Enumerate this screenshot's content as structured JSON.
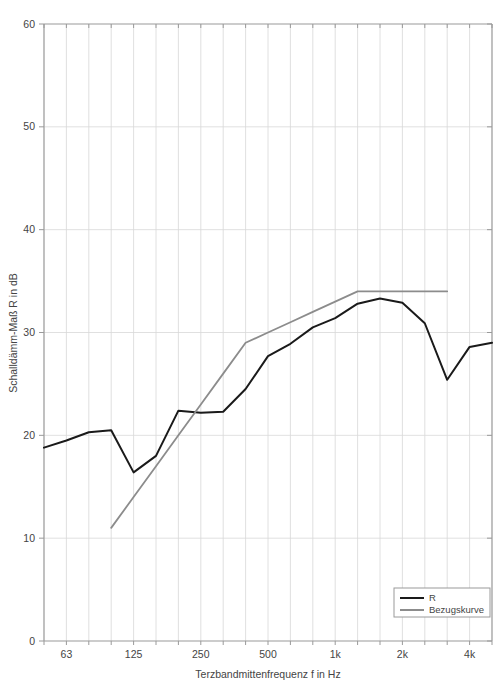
{
  "chart_data": {
    "type": "line",
    "title": "",
    "xlabel": "Terzbandmittenfrequenz f in Hz",
    "ylabel": "Schalldämm-Maß R in dB",
    "x_scale": "log-third-octave",
    "x_bands": [
      50,
      63,
      80,
      100,
      125,
      160,
      200,
      250,
      315,
      400,
      500,
      630,
      800,
      1000,
      1250,
      1600,
      2000,
      2500,
      3150,
      4000,
      5000
    ],
    "x_tick_labels": [
      "",
      "63",
      "",
      "",
      "125",
      "",
      "",
      "250",
      "",
      "",
      "500",
      "",
      "",
      "1k",
      "",
      "",
      "2k",
      "",
      "",
      "4k",
      ""
    ],
    "xlim_bands": [
      50,
      5000
    ],
    "ylim": [
      0,
      60
    ],
    "y_ticks": [
      0,
      10,
      20,
      30,
      40,
      50,
      60
    ],
    "y_tick_labels": [
      "0",
      "10",
      "20",
      "30",
      "40",
      "50",
      "60"
    ],
    "grid": "vertical-and-horizontal",
    "legend_position": "bottom-right",
    "series": [
      {
        "name": "R",
        "color": "#1a1a1a",
        "width": 2.0,
        "x": [
          50,
          63,
          80,
          100,
          125,
          160,
          200,
          250,
          315,
          400,
          500,
          630,
          800,
          1000,
          1250,
          1600,
          2000,
          2500,
          3150,
          4000,
          5000
        ],
        "values": [
          18.8,
          19.5,
          20.3,
          20.5,
          16.4,
          18.0,
          22.4,
          22.2,
          22.3,
          24.5,
          27.7,
          28.9,
          30.5,
          31.4,
          32.8,
          33.3,
          32.9,
          30.9,
          25.4,
          28.6,
          29.0
        ]
      },
      {
        "name": "Bezugskurve",
        "color": "#8c8c8c",
        "width": 1.8,
        "x": [
          100,
          125,
          160,
          200,
          250,
          315,
          400,
          500,
          630,
          800,
          1000,
          1250,
          1600,
          2000,
          2500,
          3150
        ],
        "values": [
          11.0,
          14.0,
          17.0,
          20.0,
          23.0,
          26.0,
          29.0,
          30.0,
          31.0,
          32.0,
          33.0,
          34.0,
          34.0,
          34.0,
          34.0,
          34.0
        ]
      }
    ],
    "legend_entries": [
      {
        "label": "R",
        "color": "#1a1a1a"
      },
      {
        "label": "Bezugskurve",
        "color": "#8c8c8c"
      }
    ],
    "axis_color": "#9a9a9a",
    "grid_color": "#d8d8d8",
    "background": "#ffffff"
  }
}
